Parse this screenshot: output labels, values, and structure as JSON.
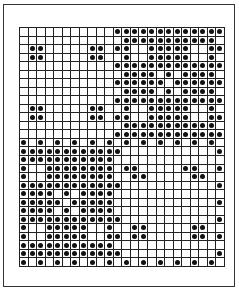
{
  "grid": {
    "columns": 24,
    "rows": 28,
    "dot_color": "#111111",
    "line_color": "#222222",
    "pattern": [
      "...........#############",
      "............###########.",
      ".##.....##.##..#####..##",
      ".##.....##..#..#####..#.",
      "...........#############",
      "............####.#.####.",
      "...........######.######",
      "............####.#.####.",
      "...........#############",
      ".##.....##..#..#####..#.",
      ".##.....##.##..#####..##",
      "............###########.",
      "...........#############",
      "#.#.#.#.#.#.#.#.#.#.#.#.",
      "############...........#",
      "###########.............",
      "#..########.##.....##..#",
      "#..########..##.....##..",
      "############...........#",
      "####.#.####.............",
      "#####.#####............#",
      "####.#.####.............",
      "############...........#",
      "#..#####..#..##.....##..",
      "#..#####..##.##.....##.#",
      "###########.............",
      "############...........#",
      "#.#.#.#.#.#.#.#.#.#.#.#."
    ]
  }
}
